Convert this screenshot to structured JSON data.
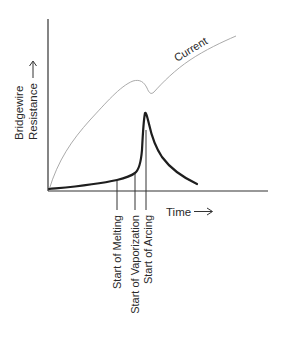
{
  "diagram": {
    "y_axis": {
      "line1": "Bridgewire",
      "line2": "Resistance",
      "arrow": "→"
    },
    "x_axis": {
      "label": "Time",
      "arrow": "⟶"
    },
    "curves": [
      {
        "name": "Current",
        "label": "Current",
        "style": "thin-gray",
        "color": "#9a9a9a"
      },
      {
        "name": "Bridgewire Resistance",
        "style": "thick-black",
        "color": "#1e1e1e"
      }
    ],
    "markers": [
      {
        "label": "Start of Melting"
      },
      {
        "label": "Start of Vaporization"
      },
      {
        "label": "Start of Arcing"
      }
    ]
  }
}
